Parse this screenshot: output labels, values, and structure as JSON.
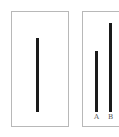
{
  "chart_data": [
    {
      "type": "bar",
      "title": "",
      "categories": [
        "reference"
      ],
      "values": [
        74
      ],
      "xlabel": "",
      "ylabel": "",
      "grid": false,
      "legend": null
    },
    {
      "type": "bar",
      "title": "",
      "categories": [
        "A",
        "B"
      ],
      "values": [
        61,
        89
      ],
      "xlabel": "",
      "ylabel": "",
      "grid": false,
      "legend": null
    }
  ],
  "labels": {
    "a": "A",
    "b": "B"
  },
  "colors": {
    "bar": "#1a1a1a",
    "frame": "#b8b8b8"
  }
}
